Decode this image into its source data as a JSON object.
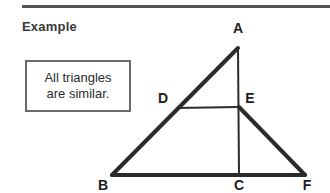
{
  "page": {
    "width": 330,
    "height": 193,
    "background_color": "#ffffff"
  },
  "header": {
    "title": "Example",
    "rule_color": "#555555"
  },
  "callout": {
    "text": "All triangles\nare similar.",
    "line1": "All triangles",
    "line2": "are similar.",
    "border_color": "#6a6a6a",
    "background_color": "#ffffff"
  },
  "figure": {
    "type": "geometry-diagram",
    "stroke_color": "#2b2b2b",
    "thick_stroke_width": 4,
    "thin_stroke_width": 2,
    "points": [
      {
        "name": "A",
        "x": 238,
        "y": 48,
        "label": "A",
        "label_x": 238,
        "label_y": 33
      },
      {
        "name": "B",
        "x": 112,
        "y": 175,
        "label": "B",
        "label_x": 103,
        "label_y": 190
      },
      {
        "name": "C",
        "x": 239,
        "y": 175,
        "label": "C",
        "label_x": 239,
        "label_y": 190
      },
      {
        "name": "D",
        "x": 176,
        "y": 108,
        "label": "D",
        "label_x": 163,
        "label_y": 103
      },
      {
        "name": "E",
        "x": 239,
        "y": 107,
        "label": "E",
        "label_x": 250,
        "label_y": 103
      },
      {
        "name": "F",
        "x": 305,
        "y": 175,
        "label": "F",
        "label_x": 307,
        "label_y": 190
      }
    ],
    "segments": [
      {
        "name": "AB",
        "from": "A",
        "to": "B",
        "weight": "thick"
      },
      {
        "name": "BF",
        "from": "B",
        "to": "F",
        "weight": "thick"
      },
      {
        "name": "EF",
        "from": "E",
        "to": "F",
        "weight": "thick"
      },
      {
        "name": "AC",
        "from": "A",
        "to": "C",
        "weight": "thin"
      },
      {
        "name": "DE",
        "from": "D",
        "to": "E",
        "weight": "thin"
      }
    ]
  }
}
